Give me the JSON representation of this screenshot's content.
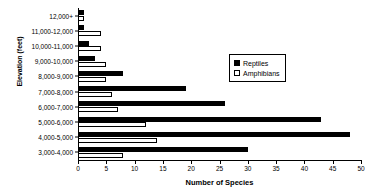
{
  "chart_data": {
    "type": "bar",
    "orientation": "horizontal",
    "title": "",
    "xlabel": "Number of Species",
    "ylabel": "Elevation (feet)",
    "xlim": [
      0,
      50
    ],
    "ylim": null,
    "grid": false,
    "legend_position": "upper right",
    "xticks": [
      0,
      5,
      10,
      15,
      20,
      25,
      30,
      35,
      40,
      45,
      50
    ],
    "xtick_labels": [
      "0",
      "5",
      "10",
      "15",
      "20",
      "25",
      "30",
      "35",
      "40",
      "45",
      "50"
    ],
    "categories": [
      "12,000+",
      "11,000-12,000",
      "10,000-11,000",
      "9,000-10,000",
      "8,000-9,000",
      "7,000-8,000",
      "6,000-7,000",
      "5,000-6,000",
      "4,000-5,000",
      "3,000-4,000"
    ],
    "series": [
      {
        "name": "Reptiles",
        "color": "#000000",
        "fill": "solid",
        "values": [
          1,
          1,
          2,
          3,
          8,
          19,
          26,
          43,
          48,
          30
        ]
      },
      {
        "name": "Amphibians",
        "color": "#ffffff",
        "fill": "hollow",
        "values": [
          1,
          4,
          4,
          5,
          5,
          6,
          7,
          12,
          14,
          8
        ]
      }
    ]
  },
  "legend": {
    "items": [
      {
        "label": "Reptiles",
        "swatch": "filled-square-icon"
      },
      {
        "label": "Amphibians",
        "swatch": "hollow-square-icon"
      }
    ]
  }
}
